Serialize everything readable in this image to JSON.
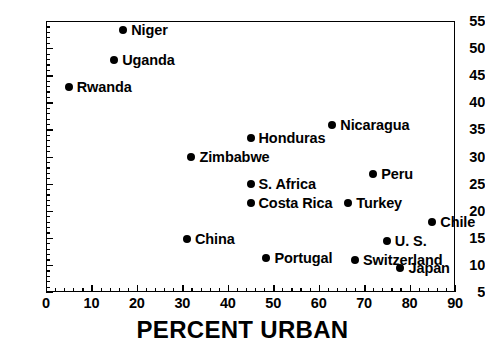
{
  "chart_data": {
    "type": "scatter",
    "title": "",
    "xlabel": "PERCENT URBAN",
    "ylabel": "",
    "xlim": [
      0,
      90
    ],
    "ylim": [
      5,
      55
    ],
    "xticks": [
      0,
      10,
      20,
      30,
      40,
      50,
      60,
      70,
      80,
      90
    ],
    "yticks": [
      5,
      10,
      15,
      20,
      25,
      30,
      35,
      40,
      45,
      50,
      55
    ],
    "xtick_labels": [
      "0",
      "10",
      "20",
      "30",
      "40",
      "50",
      "60",
      "70",
      "80",
      "90"
    ],
    "ytick_labels": [
      "5",
      "10",
      "15",
      "20",
      "25",
      "30",
      "35",
      "40",
      "45",
      "50",
      "55"
    ],
    "grid": false,
    "legend": "none",
    "minor_ticks": true,
    "marker": "filled-circle",
    "marker_color": "#000000",
    "points": [
      {
        "label": "Niger",
        "x": 17.0,
        "y": 53.5
      },
      {
        "label": "Uganda",
        "x": 15.0,
        "y": 48.0
      },
      {
        "label": "Rwanda",
        "x": 5.0,
        "y": 43.0
      },
      {
        "label": "Nicaragua",
        "x": 63.0,
        "y": 36.0
      },
      {
        "label": "Honduras",
        "x": 45.0,
        "y": 33.5
      },
      {
        "label": "Zimbabwe",
        "x": 32.0,
        "y": 30.0
      },
      {
        "label": "Peru",
        "x": 72.0,
        "y": 27.0
      },
      {
        "label": "S. Africa",
        "x": 45.0,
        "y": 25.0
      },
      {
        "label": "Costa Rica",
        "x": 45.0,
        "y": 21.5
      },
      {
        "label": "Turkey",
        "x": 66.5,
        "y": 21.5
      },
      {
        "label": "Chile",
        "x": 85.0,
        "y": 18.0
      },
      {
        "label": "China",
        "x": 31.0,
        "y": 15.0
      },
      {
        "label": "U. S.",
        "x": 75.0,
        "y": 14.5
      },
      {
        "label": "Portugal",
        "x": 48.5,
        "y": 11.5
      },
      {
        "label": "Switzerland",
        "x": 68.0,
        "y": 11.0
      },
      {
        "label": "Japan",
        "x": 78.0,
        "y": 9.5
      }
    ]
  }
}
